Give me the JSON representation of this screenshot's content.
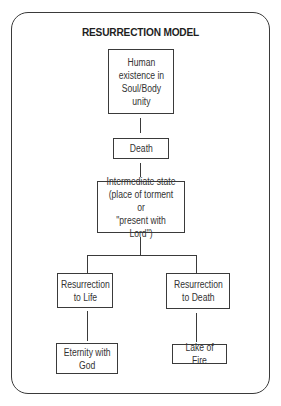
{
  "diagram": {
    "title": "RESURRECTION MODEL",
    "nodes": {
      "human_existence": "Human\nexistence in\nSoul/Body\nunity",
      "death": "Death",
      "intermediate_state": "Intermediate state\n(place of torment or\n\"present with Lord\")",
      "resurrection_to_life": "Resurrection\nto Life",
      "resurrection_to_death": "Resurrection\nto Death",
      "eternity_with_god": "Eternity with\nGod",
      "lake_of_fire": "Lake of Fire"
    },
    "edges": [
      {
        "from": "human_existence",
        "to": "death"
      },
      {
        "from": "death",
        "to": "intermediate_state"
      },
      {
        "from": "intermediate_state",
        "to": "resurrection_to_life"
      },
      {
        "from": "intermediate_state",
        "to": "resurrection_to_death"
      },
      {
        "from": "resurrection_to_life",
        "to": "eternity_with_god"
      },
      {
        "from": "resurrection_to_death",
        "to": "lake_of_fire"
      }
    ]
  }
}
